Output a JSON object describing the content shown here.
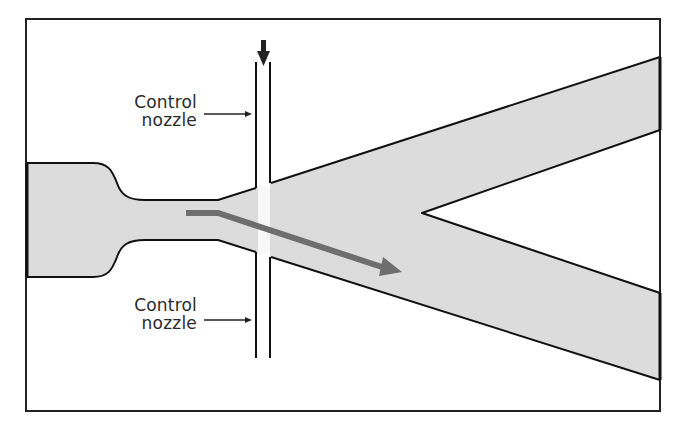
{
  "diagram": {
    "labels": {
      "control_nozzle_top": [
        "Control",
        "nozzle"
      ],
      "control_nozzle_bottom": [
        "Control",
        "nozzle"
      ]
    },
    "colors": {
      "background": "#ffffff",
      "frame": "#222222",
      "channel_fill": "#dcdcdc",
      "outline": "#111111",
      "flow_arrow": "#6e6e6e",
      "control_arrow": "#222222"
    },
    "elements": {
      "supply_inlet": "Supply inlet (left)",
      "interaction_chamber": "Interaction region",
      "splitter": "Flow splitter",
      "outlet_upper": "Upper outlet",
      "outlet_lower": "Lower outlet",
      "control_jet_arrow": "Control jet (downward)",
      "deflected_jet_arrow": "Deflected power jet"
    }
  }
}
